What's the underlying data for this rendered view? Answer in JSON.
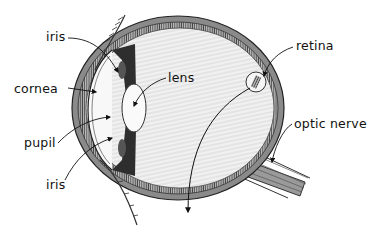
{
  "diagram": {
    "labels": {
      "iris_top": "iris",
      "cornea": "cornea",
      "pupil": "pupil",
      "iris_bottom": "iris",
      "lens": "lens",
      "retina": "retina",
      "optic_nerve": "optic nerve"
    }
  }
}
